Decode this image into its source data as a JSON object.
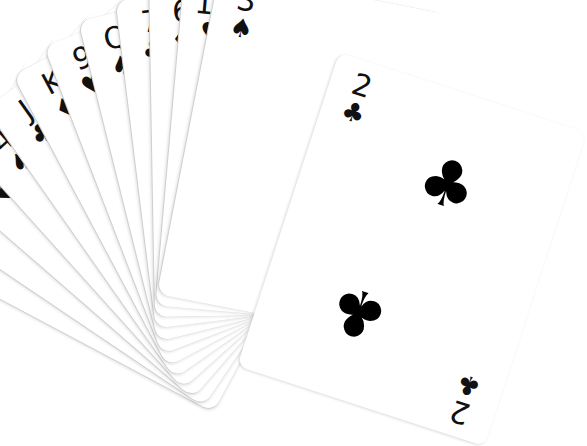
{
  "scene": {
    "description": "Hand of 13 playing cards fanned out on a white background",
    "background_color": "#ffffff",
    "ink_color": "#111111"
  },
  "cards": [
    {
      "rank": "A",
      "suit": "♣",
      "suit_name": "clubs"
    },
    {
      "rank": "8",
      "suit": "♦",
      "suit_name": "diamonds"
    },
    {
      "rank": "5",
      "suit": "♥",
      "suit_name": "hearts"
    },
    {
      "rank": "4",
      "suit": "♠",
      "suit_name": "spades"
    },
    {
      "rank": "J",
      "suit": "♣",
      "suit_name": "clubs"
    },
    {
      "rank": "K",
      "suit": "♦",
      "suit_name": "diamonds"
    },
    {
      "rank": "9",
      "suit": "♥",
      "suit_name": "hearts"
    },
    {
      "rank": "Q",
      "suit": "♠",
      "suit_name": "spades"
    },
    {
      "rank": "7",
      "suit": "♣",
      "suit_name": "clubs"
    },
    {
      "rank": "6",
      "suit": "♦",
      "suit_name": "diamonds"
    },
    {
      "rank": "10",
      "suit": "♥",
      "suit_name": "hearts"
    },
    {
      "rank": "3",
      "suit": "♠",
      "suit_name": "spades"
    },
    {
      "rank": "2",
      "suit": "♣",
      "suit_name": "clubs"
    }
  ],
  "front_card": {
    "rank": "2",
    "suit": "♣",
    "pips": [
      "♣",
      "♣"
    ]
  }
}
